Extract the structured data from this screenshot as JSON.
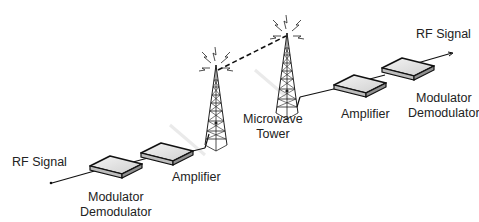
{
  "diagram": {
    "left": {
      "rf_signal": "RF Signal",
      "modem_line1": "Modulator",
      "modem_line2": "Demodulator",
      "amplifier": "Amplifier"
    },
    "center": {
      "tower_line1": "Microwave",
      "tower_line2": "Tower"
    },
    "right": {
      "rf_signal": "RF Signal",
      "modem_line1": "Modulator",
      "modem_line2": "Demodulator",
      "amplifier": "Amplifier"
    },
    "link": {
      "style": "dashed",
      "description": "wireless microwave link between towers"
    }
  }
}
